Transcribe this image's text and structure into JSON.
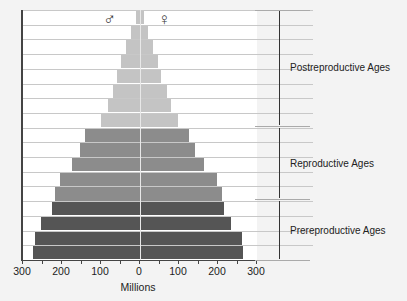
{
  "chart_data": {
    "type": "bar",
    "subtype": "population-pyramid",
    "xlabel": "Millions",
    "x_ticks": [
      "300",
      "200",
      "100",
      "0",
      "100",
      "200",
      "300"
    ],
    "xlim": [
      -300,
      300
    ],
    "legend": {
      "male_symbol": "♂",
      "female_symbol": "♀"
    },
    "groups": [
      {
        "name": "Prereproductive Ages",
        "color": "#555555"
      },
      {
        "name": "Reproductive Ages",
        "color": "#8c8c8c"
      },
      {
        "name": "Postreproductive Ages",
        "color": "#c4c4c4"
      }
    ],
    "rows_bottom_to_top": [
      {
        "group": "Prereproductive Ages",
        "male": 275,
        "female": 265
      },
      {
        "group": "Prereproductive Ages",
        "male": 268,
        "female": 262
      },
      {
        "group": "Prereproductive Ages",
        "male": 255,
        "female": 233
      },
      {
        "group": "Prereproductive Ages",
        "male": 225,
        "female": 215
      },
      {
        "group": "Reproductive Ages",
        "male": 218,
        "female": 210
      },
      {
        "group": "Reproductive Ages",
        "male": 205,
        "female": 198
      },
      {
        "group": "Reproductive Ages",
        "male": 175,
        "female": 165
      },
      {
        "group": "Reproductive Ages",
        "male": 155,
        "female": 140
      },
      {
        "group": "Reproductive Ages",
        "male": 140,
        "female": 125
      },
      {
        "group": "Postreproductive Ages",
        "male": 100,
        "female": 98
      },
      {
        "group": "Postreproductive Ages",
        "male": 82,
        "female": 80
      },
      {
        "group": "Postreproductive Ages",
        "male": 70,
        "female": 68
      },
      {
        "group": "Postreproductive Ages",
        "male": 58,
        "female": 55
      },
      {
        "group": "Postreproductive Ages",
        "male": 48,
        "female": 45
      },
      {
        "group": "Postreproductive Ages",
        "male": 36,
        "female": 34
      },
      {
        "group": "Postreproductive Ages",
        "male": 22,
        "female": 20
      },
      {
        "group": "Postreproductive Ages",
        "male": 10,
        "female": 10
      }
    ]
  },
  "labels": {
    "post": "Postreproductive Ages",
    "repro": "Reproductive Ages",
    "pre": "Prereproductive Ages",
    "xlabel": "Millions",
    "male": "♂",
    "female": "♀",
    "ticks": [
      "300",
      "200",
      "100",
      "0",
      "100",
      "200",
      "300"
    ]
  }
}
